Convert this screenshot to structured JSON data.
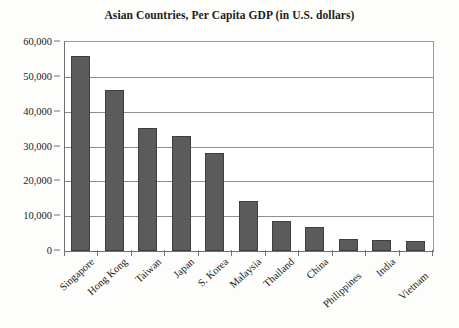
{
  "chart_data": {
    "type": "bar",
    "title": "Asian Countries, Per Capita GDP (in U.S. dollars)",
    "xlabel": "",
    "ylabel": "",
    "categories": [
      "Singapore",
      "Hong Kong",
      "Taiwan",
      "Japan",
      "S. Korea",
      "Malaysia",
      "Thailand",
      "China",
      "Philippines",
      "India",
      "Vietnam"
    ],
    "values": [
      56000,
      46200,
      35300,
      33000,
      28100,
      14400,
      8600,
      6800,
      3400,
      3100,
      2800
    ],
    "ylim": [
      0,
      60000
    ],
    "ytick_values": [
      0,
      10000,
      20000,
      30000,
      40000,
      50000,
      60000
    ],
    "ytick_labels": [
      "0",
      "10,000",
      "20,000",
      "30,000",
      "40,000",
      "50,000",
      "60,000"
    ],
    "grid": true,
    "legend": false,
    "bar_color": "#5b5b5b",
    "bar_edge_color": "#3f3f3f",
    "axis_color": "#70706e",
    "grid_color": "#8e8e8c",
    "background_color": "#ffffff",
    "text_color": "#1b1b1b"
  }
}
